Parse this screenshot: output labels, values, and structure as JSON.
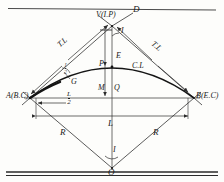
{
  "figure": {
    "ink_color": "#1a1a1a",
    "line_color": "#555555",
    "background": "#fdfdfb"
  },
  "rules": {
    "top_rule": "",
    "bottom_rule_upper": "",
    "bottom_rule_lower": ""
  },
  "points": {
    "vertex": "V(I.P)",
    "begin_curve": "A(B.C)",
    "end_curve": "B(E.C)",
    "center": "O",
    "tangent_extension": "D",
    "mid_curve": "P",
    "mid_chord": "Q",
    "arc_point": "G"
  },
  "dimensions": {
    "tangent_left": "T.L",
    "tangent_right": "T.L",
    "radius_left": "R",
    "radius_right": "R",
    "chord": "L",
    "half_chord_num": "L",
    "half_chord_den": "2",
    "external": "E",
    "middle_ordinate": "M",
    "curve_length": "C.L",
    "intersection_angle": "I",
    "central_angle": "I",
    "half_angle_num": "I",
    "half_angle_den": "2"
  }
}
